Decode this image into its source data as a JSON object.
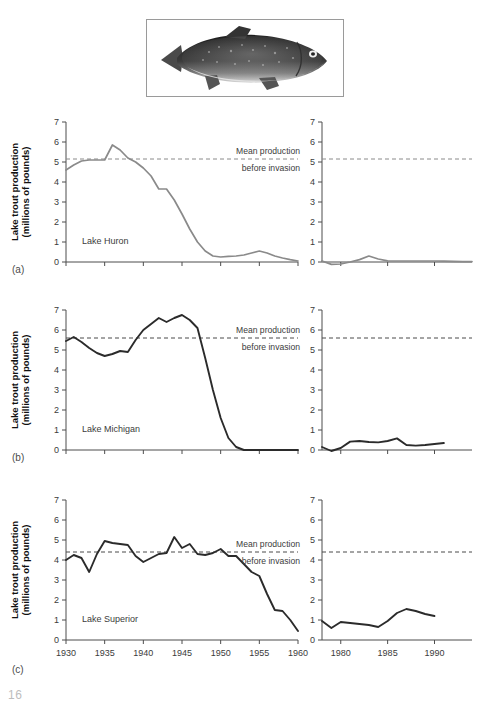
{
  "figure": {
    "image_caption_alt": "lake trout photograph",
    "page_number": "16",
    "panel_labels": [
      "(a)",
      "(b)",
      "(c)"
    ]
  },
  "axes": {
    "ylabel_line1": "Lake trout production",
    "ylabel_line2": "(millions of pounds)",
    "y_ticks": [
      "0",
      "1",
      "2",
      "3",
      "4",
      "5",
      "6",
      "7"
    ],
    "ylim": [
      0,
      7
    ],
    "left_x_ticks": [
      "1930",
      "1935",
      "1940",
      "1945",
      "1950",
      "1955",
      "1960"
    ],
    "left_xlim": [
      1930,
      1960
    ],
    "right_x_ticks": [
      "1980",
      "1985",
      "1990"
    ],
    "right_xlim": [
      1978,
      1994
    ]
  },
  "annotation": {
    "line1": "Mean production",
    "line2": "before invasion"
  },
  "colors": {
    "huron_line": "#8a8a8a",
    "michigan_line": "#2b2b2b",
    "superior_line": "#2b2b2b",
    "mean_line_huron": "#8a8a8a",
    "mean_line_dark": "#4a4a4a",
    "axis": "#4d4d4d"
  },
  "chart_data": [
    {
      "type": "line",
      "panel": "(a)",
      "series_label": "Lake Huron",
      "title": "",
      "xlabel": "",
      "ylabel": "Lake trout production (millions of pounds)",
      "ylim": [
        0,
        7
      ],
      "grid": false,
      "legend": "none",
      "mean_before_invasion": 5.15,
      "segments": [
        {
          "name": "Lake Huron 1930-1960",
          "xlim": [
            1930,
            1960
          ],
          "x": [
            1930,
            1931,
            1932,
            1933,
            1934,
            1935,
            1936,
            1937,
            1938,
            1939,
            1940,
            1941,
            1942,
            1943,
            1944,
            1945,
            1946,
            1947,
            1948,
            1949,
            1950,
            1951,
            1952,
            1953,
            1954,
            1955,
            1956,
            1957,
            1958,
            1959,
            1960
          ],
          "y": [
            4.6,
            4.85,
            5.05,
            5.1,
            5.1,
            5.1,
            5.85,
            5.6,
            5.2,
            5.0,
            4.7,
            4.3,
            3.65,
            3.65,
            3.1,
            2.4,
            1.65,
            1.0,
            0.55,
            0.3,
            0.25,
            0.28,
            0.3,
            0.35,
            0.45,
            0.55,
            0.45,
            0.3,
            0.2,
            0.12,
            0.05
          ]
        },
        {
          "name": "Lake Huron 1978-1994",
          "xlim": [
            1978,
            1994
          ],
          "x": [
            1978,
            1979,
            1980,
            1981,
            1982,
            1983,
            1984,
            1985,
            1986,
            1987,
            1988,
            1989,
            1990,
            1991,
            1992,
            1993,
            1994
          ],
          "y": [
            0.05,
            -0.12,
            -0.1,
            0.0,
            0.12,
            0.3,
            0.15,
            0.06,
            0.05,
            0.05,
            0.05,
            0.05,
            0.05,
            0.04,
            0.03,
            0.02,
            0.02
          ]
        }
      ]
    },
    {
      "type": "line",
      "panel": "(b)",
      "series_label": "Lake Michigan",
      "title": "",
      "xlabel": "",
      "ylabel": "Lake trout production (millions of pounds)",
      "ylim": [
        0,
        7
      ],
      "grid": false,
      "legend": "none",
      "mean_before_invasion": 5.6,
      "segments": [
        {
          "name": "Lake Michigan 1930-1960",
          "xlim": [
            1930,
            1960
          ],
          "x": [
            1930,
            1931,
            1932,
            1933,
            1934,
            1935,
            1936,
            1937,
            1938,
            1939,
            1940,
            1941,
            1942,
            1943,
            1944,
            1945,
            1946,
            1947,
            1948,
            1949,
            1950,
            1951,
            1952,
            1953,
            1954,
            1955,
            1956,
            1957,
            1958,
            1959,
            1960
          ],
          "y": [
            5.45,
            5.65,
            5.4,
            5.1,
            4.85,
            4.7,
            4.8,
            4.95,
            4.9,
            5.5,
            6.0,
            6.3,
            6.6,
            6.4,
            6.6,
            6.75,
            6.5,
            6.1,
            4.6,
            3.0,
            1.6,
            0.6,
            0.15,
            0.0,
            0.0,
            0.0,
            0.0,
            0.0,
            0.0,
            0.0,
            0.0
          ]
        },
        {
          "name": "Lake Michigan 1978-1994",
          "xlim": [
            1978,
            1994
          ],
          "x": [
            1978,
            1979,
            1980,
            1981,
            1982,
            1983,
            1984,
            1985,
            1986,
            1987,
            1988,
            1989,
            1990,
            1991
          ],
          "y": [
            0.15,
            -0.05,
            0.1,
            0.42,
            0.45,
            0.4,
            0.38,
            0.45,
            0.58,
            0.25,
            0.22,
            0.25,
            0.3,
            0.35
          ]
        }
      ]
    },
    {
      "type": "line",
      "panel": "(c)",
      "series_label": "Lake Superior",
      "title": "",
      "xlabel": "",
      "ylabel": "Lake trout production (millions of pounds)",
      "ylim": [
        0,
        7
      ],
      "grid": false,
      "legend": "none",
      "mean_before_invasion": 4.4,
      "segments": [
        {
          "name": "Lake Superior 1930-1960",
          "xlim": [
            1930,
            1960
          ],
          "x": [
            1930,
            1931,
            1932,
            1933,
            1934,
            1935,
            1936,
            1937,
            1938,
            1939,
            1940,
            1941,
            1942,
            1943,
            1944,
            1945,
            1946,
            1947,
            1948,
            1949,
            1950,
            1951,
            1952,
            1953,
            1954,
            1955,
            1956,
            1957,
            1958,
            1959,
            1960
          ],
          "y": [
            4.0,
            4.25,
            4.1,
            3.4,
            4.3,
            4.95,
            4.85,
            4.8,
            4.75,
            4.2,
            3.9,
            4.1,
            4.3,
            4.35,
            5.15,
            4.6,
            4.8,
            4.3,
            4.25,
            4.35,
            4.55,
            4.2,
            4.2,
            3.8,
            3.4,
            3.2,
            2.3,
            1.5,
            1.45,
            1.0,
            0.45
          ]
        },
        {
          "name": "Lake Superior 1978-1994",
          "xlim": [
            1978,
            1994
          ],
          "x": [
            1978,
            1979,
            1980,
            1981,
            1982,
            1983,
            1984,
            1985,
            1986,
            1987,
            1988,
            1989,
            1990
          ],
          "y": [
            0.95,
            0.6,
            0.9,
            0.85,
            0.8,
            0.75,
            0.65,
            0.95,
            1.35,
            1.55,
            1.45,
            1.3,
            1.2
          ]
        }
      ]
    }
  ]
}
